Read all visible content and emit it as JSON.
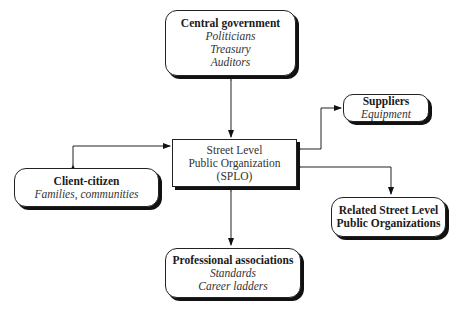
{
  "diagram": {
    "center": {
      "lines": [
        "Street Level",
        "Public Organization",
        "(SPLO)"
      ]
    },
    "nodes": {
      "central_government": {
        "title": "Central government",
        "items": [
          "Politicians",
          "Treasury",
          "Auditors"
        ]
      },
      "suppliers": {
        "title": "Suppliers",
        "items": [
          "Equipment"
        ]
      },
      "client_citizen": {
        "title": "Client-citizen",
        "items": [
          "Families, communities"
        ]
      },
      "related_orgs": {
        "title_lines": [
          "Related Street Level",
          "Public Organizations"
        ]
      },
      "professional_associations": {
        "title": "Professional associations",
        "items": [
          "Standards",
          "Career ladders"
        ]
      }
    },
    "edges": [
      {
        "from": "center",
        "to": "central_government",
        "type": "bidirectional"
      },
      {
        "from": "center",
        "to": "suppliers",
        "type": "bidirectional"
      },
      {
        "from": "center",
        "to": "client_citizen",
        "type": "bidirectional"
      },
      {
        "from": "center",
        "to": "related_orgs",
        "type": "bidirectional"
      },
      {
        "from": "center",
        "to": "professional_associations",
        "type": "bidirectional"
      }
    ]
  }
}
